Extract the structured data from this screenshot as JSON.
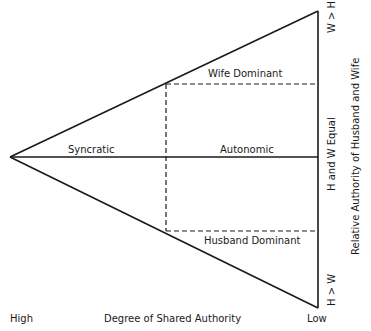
{
  "diagram": {
    "regions": {
      "wife_dominant": "Wife Dominant",
      "syncratic": "Syncratic",
      "autonomic": "Autonomic",
      "husband_dominant": "Husband Dominant"
    },
    "x_axis": {
      "title": "Degree of Shared Authority",
      "left_label": "High",
      "right_label": "Low"
    },
    "y_axis": {
      "title": "Relative Authority of Husband and Wife",
      "top_label": "W > H",
      "middle_label": "H and W Equal",
      "bottom_label": "H > W"
    },
    "geometry": {
      "apex": [
        10,
        157
      ],
      "right_top": [
        318,
        11
      ],
      "right_bottom": [
        318,
        308
      ],
      "dashed_vertical_x": 166,
      "dashed_top_y": 84,
      "dashed_bottom_y": 231,
      "midline_y": 157
    },
    "colors": {
      "line": "#1a1a1a",
      "background": "#ffffff"
    }
  }
}
